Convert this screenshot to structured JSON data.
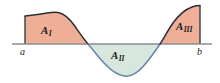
{
  "figure": {
    "background_color": "#ffffff",
    "axis": {
      "name": "x-axis",
      "color": "#8c8c92",
      "y_position": 44,
      "x_start": 12,
      "x_end": 212,
      "stroke_width": 1.4
    },
    "endpoints": {
      "left": {
        "label": "a",
        "x": 25,
        "tick_name": "left-boundary-a"
      },
      "right": {
        "label": "b",
        "x": 200,
        "tick_name": "right-boundary-b"
      }
    },
    "regions": [
      {
        "id": "A-one",
        "base_label": "A",
        "subscript": "I",
        "fill_color": "#efae96",
        "stroke_color": "#2d2d3a",
        "sign": "positive",
        "side": "above-axis",
        "x_from": 25,
        "x_to": 88
      },
      {
        "id": "A-two",
        "base_label": "A",
        "subscript": "II",
        "fill_color": "#d8e7de",
        "stroke_color": "#5f86ad",
        "sign": "negative",
        "side": "below-axis",
        "x_from": 88,
        "x_to": 160
      },
      {
        "id": "A-three",
        "base_label": "A",
        "subscript": "III",
        "fill_color": "#efae96",
        "stroke_color": "#2d2d3a",
        "sign": "positive",
        "side": "above-axis",
        "x_from": 160,
        "x_to": 200
      }
    ],
    "curve": {
      "name": "sinusoidal-curve",
      "upper_stroke_color": "#2d2d3a",
      "lower_stroke_color": "#5f86ad",
      "stroke_width": 1.5,
      "peak": {
        "x": 56,
        "y": 12
      },
      "trough": {
        "x": 125,
        "y": 76
      },
      "zero_crossings": [
        88,
        160
      ],
      "left_edge_y": 16,
      "right_edge_y": 6
    }
  }
}
